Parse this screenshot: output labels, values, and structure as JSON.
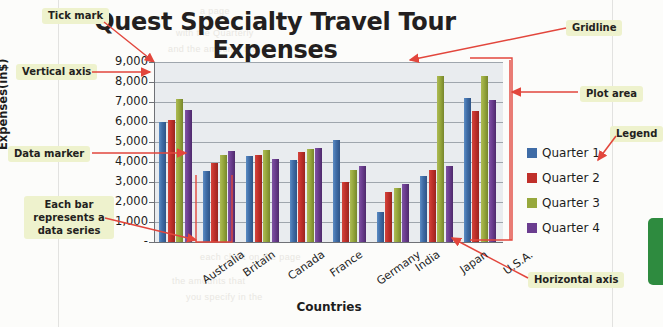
{
  "figure": {
    "type": "textbook-annotated-chart"
  },
  "chart_data": {
    "type": "bar",
    "title": "Quest Specialty Travel Tour Expenses",
    "xlabel": "Countries",
    "ylabel": "Expenses(in$)",
    "categories": [
      "Australia",
      "Britain",
      "Canada",
      "France",
      "Germany",
      "India",
      "Japan",
      "U.S.A."
    ],
    "series": [
      {
        "name": "Quarter 1",
        "color": "#3f6ca6",
        "values": [
          6000,
          3550,
          4300,
          4100,
          5100,
          1500,
          3300,
          7200
        ]
      },
      {
        "name": "Quarter 2",
        "color": "#c0302b",
        "values": [
          6100,
          3950,
          4350,
          4500,
          3000,
          2500,
          3600,
          6550
        ]
      },
      {
        "name": "Quarter 3",
        "color": "#97a83c",
        "values": [
          7150,
          4350,
          4600,
          4650,
          3600,
          2700,
          8300,
          8300
        ]
      },
      {
        "name": "Quarter 4",
        "color": "#6b3d8f",
        "values": [
          6600,
          4550,
          4150,
          4700,
          3800,
          2900,
          3800,
          7100
        ]
      }
    ],
    "ylim": [
      0,
      9000
    ],
    "ytick_values": [
      0,
      1000,
      2000,
      3000,
      4000,
      5000,
      6000,
      7000,
      8000,
      9000
    ],
    "ytick_labels": [
      "-",
      "1,000",
      "2,000",
      "3,000",
      "4,000",
      "5,000",
      "6,000",
      "7,000",
      "8,000",
      "9,000"
    ],
    "grid": true,
    "legend_position": "right",
    "plot_area_color": "#e9ecef",
    "gridline_color": "#9fa6ad"
  },
  "annotations": {
    "color": "#e2463c",
    "items": [
      {
        "id": "tick-mark",
        "label": "Tick mark"
      },
      {
        "id": "vertical-axis",
        "label": "Vertical axis"
      },
      {
        "id": "data-marker",
        "label": "Data marker"
      },
      {
        "id": "each-bar-series",
        "label": "Each bar represents a data series"
      },
      {
        "id": "gridline",
        "label": "Gridline"
      },
      {
        "id": "plot-area",
        "label": "Plot area"
      },
      {
        "id": "legend",
        "label": "Legend"
      },
      {
        "id": "horizontal-axis",
        "label": "Horizontal axis"
      }
    ]
  },
  "ghost_text": [
    "a page",
    "with the Quarterly",
    "and the amounts the",
    "with the Current Charts folder",
    "Chart Columns",
    "the values on the",
    "er only",
    "the amounts that",
    "you specify in the",
    "each chart on the page"
  ]
}
